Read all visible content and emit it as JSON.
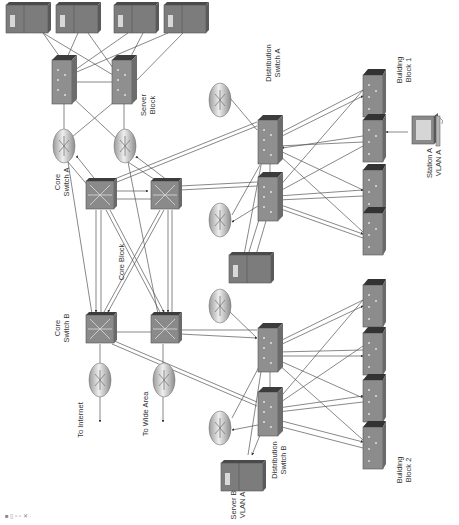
{
  "diagram": {
    "orientation": "rotated 90 degrees counter-clockwise",
    "colors": {
      "device_fill": "#8a8a8a",
      "device_dark": "#3a3a3a",
      "device_light": "#b0b0b0",
      "router_fill": "#c8c8c8",
      "link": "#555555",
      "text": "#333333"
    },
    "labels": {
      "server_block": [
        "Server",
        "Block"
      ],
      "core_switch_a": [
        "Core",
        "Switch A"
      ],
      "core_switch_b": [
        "Core",
        "Switch B"
      ],
      "core_block": "Core Block",
      "distribution_switch_a": [
        "Distribution",
        "Switch A"
      ],
      "distribution_switch_b": [
        "Distribution",
        "Switch B"
      ],
      "building_block_1": [
        "Building",
        "Block 1"
      ],
      "building_block_2": [
        "Building",
        "Block 2"
      ],
      "station_a": [
        "Station A",
        "VLAN A"
      ],
      "server_b": [
        "Server B",
        "VLAN A"
      ],
      "to_internet": "To Internet",
      "to_wide_area": "To Wide Area"
    },
    "nodes": {
      "servers": [
        {
          "id": "server-1",
          "type": "server"
        },
        {
          "id": "server-2",
          "type": "server"
        },
        {
          "id": "server-3",
          "type": "server"
        },
        {
          "id": "server-4",
          "type": "server"
        }
      ],
      "server_block_switches": [
        {
          "id": "server-switch-1",
          "type": "multilayer-switch"
        },
        {
          "id": "server-switch-2",
          "type": "multilayer-switch"
        }
      ],
      "server_block_routers": [
        {
          "id": "server-router-1",
          "type": "router"
        },
        {
          "id": "server-router-2",
          "type": "router"
        }
      ],
      "core_switches": [
        {
          "id": "core-switch-a",
          "label": "Core Switch A",
          "type": "core-switch"
        },
        {
          "id": "core-switch-a2",
          "type": "core-switch"
        },
        {
          "id": "core-switch-b",
          "label": "Core Switch B",
          "type": "core-switch"
        },
        {
          "id": "core-switch-b2",
          "type": "core-switch"
        }
      ],
      "edge_routers": [
        {
          "id": "internet-router",
          "label": "To Internet",
          "type": "router"
        },
        {
          "id": "wan-router",
          "label": "To Wide Area",
          "type": "router"
        }
      ],
      "distribution_a": [
        {
          "id": "distribution-switch-a",
          "label": "Distribution Switch A",
          "type": "multilayer-switch"
        },
        {
          "id": "distribution-switch-a2",
          "type": "multilayer-switch"
        }
      ],
      "distribution_b": [
        {
          "id": "distribution-switch-b",
          "label": "Distribution Switch B",
          "type": "multilayer-switch"
        },
        {
          "id": "distribution-switch-b2",
          "type": "multilayer-switch"
        }
      ],
      "building_block_1_switches": 4,
      "building_block_2_switches": 4,
      "station": {
        "id": "station-a",
        "label": "Station A VLAN A",
        "type": "workstation"
      },
      "server_b": {
        "id": "server-b",
        "label": "Server B VLAN A",
        "type": "server"
      }
    },
    "footer_text": "■ ▯ ▫ ▫ ✕ ·"
  }
}
